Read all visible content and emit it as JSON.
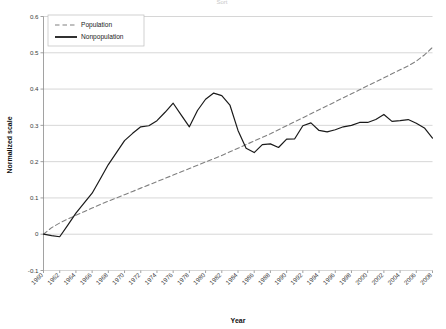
{
  "chart_data": {
    "type": "line",
    "title": "Sort",
    "xlabel": "Year",
    "ylabel": "Normalized scale",
    "xlim": [
      1960,
      2008
    ],
    "ylim": [
      -0.1,
      0.6
    ],
    "ytick_labels": [
      "0.6",
      "0.5",
      "0.4",
      "0.3",
      "0.2",
      "0.1",
      "0",
      "-0.1"
    ],
    "ytick_values": [
      0.6,
      0.5,
      0.4,
      0.3,
      0.2,
      0.1,
      0,
      -0.1
    ],
    "xtick_labels": [
      "1960",
      "1962",
      "1964",
      "1966",
      "1968",
      "1970",
      "1972",
      "1974",
      "1976",
      "1978",
      "1980",
      "1982",
      "1984",
      "1986",
      "1988",
      "1990",
      "1992",
      "1994",
      "1996",
      "1998",
      "2000",
      "2002",
      "2004",
      "2006",
      "2008"
    ],
    "grid": "horizontal",
    "legend_position": "top-left",
    "x": [
      1960,
      1961,
      1962,
      1963,
      1964,
      1965,
      1966,
      1967,
      1968,
      1969,
      1970,
      1971,
      1972,
      1973,
      1974,
      1975,
      1976,
      1977,
      1978,
      1979,
      1980,
      1981,
      1982,
      1983,
      1984,
      1985,
      1986,
      1987,
      1988,
      1989,
      1990,
      1991,
      1992,
      1993,
      1994,
      1995,
      1996,
      1997,
      1998,
      1999,
      2000,
      2001,
      2002,
      2003,
      2004,
      2005,
      2006,
      2007,
      2008
    ],
    "series": [
      {
        "name": "Population",
        "color": "#808080",
        "style": "dashed",
        "values": [
          0.0,
          0.018,
          0.031,
          0.042,
          0.052,
          0.062,
          0.072,
          0.082,
          0.091,
          0.1,
          0.109,
          0.118,
          0.127,
          0.136,
          0.145,
          0.154,
          0.163,
          0.172,
          0.181,
          0.19,
          0.199,
          0.208,
          0.217,
          0.227,
          0.237,
          0.247,
          0.257,
          0.267,
          0.277,
          0.288,
          0.299,
          0.31,
          0.321,
          0.332,
          0.343,
          0.354,
          0.365,
          0.376,
          0.387,
          0.398,
          0.409,
          0.42,
          0.431,
          0.442,
          0.453,
          0.464,
          0.477,
          0.494,
          0.515
        ]
      },
      {
        "name": "Nonpopulation",
        "color": "#1a1a1a",
        "style": "solid",
        "values": [
          0.0,
          -0.004,
          -0.007,
          0.025,
          0.058,
          0.086,
          0.113,
          0.152,
          0.192,
          0.225,
          0.258,
          0.278,
          0.296,
          0.299,
          0.313,
          0.336,
          0.361,
          0.328,
          0.296,
          0.341,
          0.372,
          0.389,
          0.382,
          0.356,
          0.286,
          0.237,
          0.225,
          0.247,
          0.249,
          0.239,
          0.262,
          0.263,
          0.299,
          0.307,
          0.286,
          0.282,
          0.288,
          0.296,
          0.3,
          0.308,
          0.308,
          0.316,
          0.33,
          0.311,
          0.313,
          0.316,
          0.306,
          0.293,
          0.265
        ]
      }
    ]
  }
}
